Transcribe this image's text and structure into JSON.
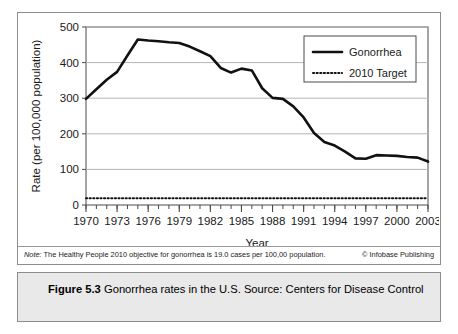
{
  "figure": {
    "caption_label": "Figure 5.3",
    "caption_body": "Gonorrhea rates in the U.S. Source: Centers for Disease Control"
  },
  "note": {
    "lead": "Note:",
    "body": "The Healthy People 2010 objective for gonorrhea is 19.0 cases per 100,00 population.",
    "credit": "© Infobase Publishing"
  },
  "colors": {
    "series_line": "#111111",
    "target_line": "#111111",
    "gridline": "#b5b5b5",
    "axis": "#4a4a4a",
    "panel_border": "#8d8d8d",
    "caption_bg": "#e9e9e9",
    "page_bg": "#ffffff"
  },
  "chart_data": {
    "type": "line",
    "title": "",
    "xlabel": "Year",
    "ylabel": "Rate (per 100,000 population)",
    "xlim": [
      1970,
      2003
    ],
    "ylim": [
      0,
      500
    ],
    "ytick_values": [
      0,
      100,
      200,
      300,
      400,
      500
    ],
    "ytick_labels": [
      "0",
      "100",
      "200",
      "300",
      "400",
      "500"
    ],
    "xtick_values": [
      1970,
      1973,
      1976,
      1979,
      1982,
      1985,
      1988,
      1991,
      1994,
      1997,
      2000,
      2003
    ],
    "xtick_labels": [
      "1970",
      "1973",
      "1976",
      "1979",
      "1982",
      "1985",
      "1988",
      "1991",
      "1994",
      "1997",
      "2000",
      "2003"
    ],
    "x_minor_step": 1,
    "grid": "horizontal",
    "legend_position": "top-right",
    "series": [
      {
        "name": "Gonorrhea",
        "style": "solid",
        "x": [
          1970,
          1971,
          1972,
          1973,
          1974,
          1975,
          1976,
          1977,
          1978,
          1979,
          1980,
          1981,
          1982,
          1983,
          1984,
          1985,
          1986,
          1987,
          1988,
          1989,
          1990,
          1991,
          1992,
          1993,
          1994,
          1995,
          1996,
          1997,
          1998,
          1999,
          2000,
          2001,
          2002,
          2003
        ],
        "values": [
          298,
          325,
          352,
          374,
          420,
          465,
          462,
          460,
          457,
          455,
          445,
          432,
          418,
          385,
          372,
          383,
          378,
          328,
          301,
          298,
          277,
          246,
          202,
          177,
          167,
          150,
          131,
          130,
          140,
          139,
          138,
          135,
          133,
          122
        ]
      },
      {
        "name": "2010 Target",
        "style": "dotted",
        "x": [
          1970,
          2003
        ],
        "values": [
          19,
          19
        ]
      }
    ],
    "legend": [
      {
        "label": "Gonorrhea",
        "style": "solid"
      },
      {
        "label": "2010 Target",
        "style": "dotted"
      }
    ]
  }
}
